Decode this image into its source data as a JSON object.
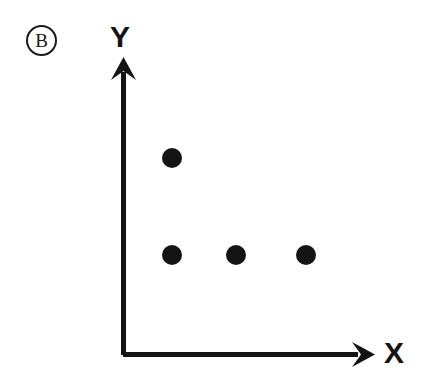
{
  "panel": {
    "label": "B",
    "label_shape": "circled-letter",
    "background_color": "#ffffff",
    "ink_color": "#1a1a1a"
  },
  "axes": {
    "y": {
      "label": "Y",
      "icon": "up-arrow-axis",
      "line_x": 123.5,
      "top_y": 57,
      "bottom_y": 355
    },
    "x": {
      "label": "X",
      "icon": "right-arrow-axis",
      "line_y": 354.5,
      "left_x": 123,
      "right_x": 375
    }
  },
  "chart_data": {
    "type": "scatter",
    "title": "",
    "subtitle": "",
    "xlabel": "X",
    "ylabel": "Y",
    "legend": [],
    "legend_position": "none",
    "grid": false,
    "axis_arrows": true,
    "ticks": {
      "x": [],
      "y": []
    },
    "xlim": [
      0,
      10
    ],
    "ylim": [
      0,
      10
    ],
    "marker": {
      "shape": "circle",
      "color": "#141414",
      "radius_px": 10
    },
    "series": [
      {
        "name": "points",
        "points": [
          {
            "px": 172,
            "py": 158,
            "x": 2,
            "y": 6.6
          },
          {
            "px": 172,
            "py": 255,
            "x": 2,
            "y": 3.3
          },
          {
            "px": 236,
            "py": 255,
            "x": 4.5,
            "y": 3.3
          },
          {
            "px": 306,
            "py": 255,
            "x": 7.3,
            "y": 3.3
          }
        ]
      }
    ],
    "point_count": 4
  }
}
